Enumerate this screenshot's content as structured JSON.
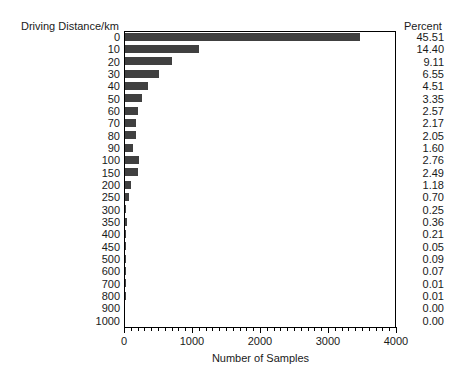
{
  "chart_data": {
    "type": "bar",
    "orientation": "horizontal",
    "title": "",
    "ylabel": "Driving Distance/km",
    "xlabel": "Number of Samples",
    "xlim": [
      0,
      4000
    ],
    "xticks": [
      0,
      1000,
      2000,
      3000,
      4000
    ],
    "xtick_labels": [
      "0",
      "1000",
      "2000",
      "3000",
      "4000"
    ],
    "grid": false,
    "legend": false,
    "bar_color": "#404040",
    "percent_column_header": "Percent",
    "categories": [
      "0",
      "10",
      "20",
      "30",
      "40",
      "50",
      "60",
      "70",
      "80",
      "90",
      "100",
      "150",
      "200",
      "250",
      "300",
      "350",
      "400",
      "450",
      "500",
      "600",
      "700",
      "800",
      "900",
      "1000"
    ],
    "values": [
      3459,
      1094,
      692,
      498,
      343,
      255,
      195,
      165,
      156,
      122,
      210,
      189,
      90,
      53,
      19,
      27,
      16,
      4,
      7,
      5,
      1,
      1,
      0,
      0
    ],
    "percents": [
      "45.51",
      "14.40",
      "9.11",
      "6.55",
      "4.51",
      "3.35",
      "2.57",
      "2.17",
      "2.05",
      "1.60",
      "2.76",
      "2.49",
      "1.18",
      "0.70",
      "0.25",
      "0.36",
      "0.21",
      "0.05",
      "0.09",
      "0.07",
      "0.01",
      "0.01",
      "0.00",
      "0.00"
    ],
    "percent_values": [
      45.51,
      14.4,
      9.11,
      6.55,
      4.51,
      3.35,
      2.57,
      2.17,
      2.05,
      1.6,
      2.76,
      2.49,
      1.18,
      0.7,
      0.25,
      0.36,
      0.21,
      0.05,
      0.09,
      0.07,
      0.01,
      0.01,
      0.0,
      0.0
    ]
  }
}
